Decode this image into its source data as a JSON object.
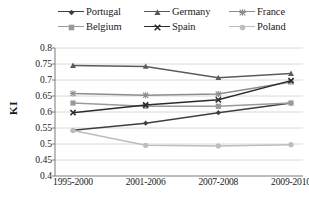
{
  "chart_data": {
    "type": "line",
    "title": "",
    "xlabel": "",
    "ylabel": "KI",
    "categories": [
      "1995-2000",
      "2001-2006",
      "2007-2008",
      "2009-2010"
    ],
    "ylim": [
      0.4,
      0.8
    ],
    "ytick_values": [
      0.8,
      0.75,
      0.7,
      0.65,
      0.6,
      0.55,
      0.5,
      0.45,
      0.4
    ],
    "ytick_labels": [
      "0.8",
      "0.75",
      "0.7",
      "0.65",
      "0.6",
      "0.55",
      "0.5",
      "0.45",
      "0.4"
    ],
    "grid": true,
    "legend_position": "top",
    "series": [
      {
        "name": "Portugal",
        "marker": "diamond",
        "color": "#3f3f3f",
        "values": [
          0.543,
          0.565,
          0.598,
          0.628
        ]
      },
      {
        "name": "Germany",
        "marker": "triangle",
        "color": "#5a5a5a",
        "values": [
          0.745,
          0.742,
          0.707,
          0.72
        ]
      },
      {
        "name": "France",
        "marker": "asterisk",
        "color": "#8c8c8c",
        "values": [
          0.658,
          0.652,
          0.656,
          0.694
        ]
      },
      {
        "name": "Belgium",
        "marker": "square",
        "color": "#9a9a9a",
        "values": [
          0.628,
          0.618,
          0.618,
          0.628
        ]
      },
      {
        "name": "Spain",
        "marker": "cross",
        "color": "#2b2b2b",
        "values": [
          0.598,
          0.622,
          0.638,
          0.698
        ]
      },
      {
        "name": "Poland",
        "marker": "circle",
        "color": "#bdbdbd",
        "values": [
          0.542,
          0.496,
          0.494,
          0.498
        ]
      }
    ]
  },
  "legend": {
    "items": [
      {
        "label": "Portugal"
      },
      {
        "label": "Germany"
      },
      {
        "label": "France"
      },
      {
        "label": "Belgium"
      },
      {
        "label": "Spain"
      },
      {
        "label": "Poland"
      }
    ]
  },
  "axes": {
    "y_title": "KI"
  },
  "colors": {
    "axis": "#7a7a7a",
    "grid": "#d4d4d4",
    "background": "#ffffff"
  }
}
